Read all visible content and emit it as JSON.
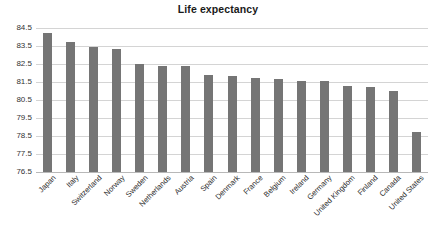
{
  "chart_data": {
    "type": "bar",
    "title": "Life expectancy",
    "xlabel": "",
    "ylabel": "",
    "ylim": [
      76.5,
      84.5
    ],
    "yticks": [
      76.5,
      77.5,
      78.5,
      79.5,
      80.5,
      81.5,
      82.5,
      83.5,
      84.5
    ],
    "ytick_labels": [
      "76.5",
      "77.5",
      "78.5",
      "79.5",
      "80.5",
      "81.5",
      "82.5",
      "83.5",
      "84.5"
    ],
    "grid": true,
    "legend": false,
    "bar_color": "#757575",
    "gridline_color": "#d4d4d4",
    "background_color": "#ffffff",
    "categories": [
      "Japan",
      "Italy",
      "Switzerland",
      "Norway",
      "Sweden",
      "Netherlands",
      "Austria",
      "Spain",
      "Denmark",
      "France",
      "Belgium",
      "Ireland",
      "Germany",
      "United Kingdom",
      "Finland",
      "Canada",
      "United States"
    ],
    "values": [
      84.2,
      83.7,
      83.45,
      83.35,
      82.5,
      82.4,
      82.4,
      81.9,
      81.85,
      81.75,
      81.65,
      81.55,
      81.55,
      81.3,
      81.2,
      81.0,
      78.7
    ]
  }
}
